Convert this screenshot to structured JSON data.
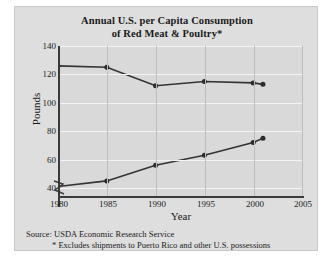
{
  "figure": {
    "title_line1": "Annual U.S. per Capita Consumption",
    "title_line2": "of Red Meat & Poultry*",
    "source": "Source: USDA Economic Research Service",
    "footnote": "* Excludes shipments to Puerto Rico and other U.S. possessions",
    "background_color": "#dedede",
    "plot_background_color": "#d9d9d9",
    "line_color": "#333333",
    "hgrid_color": "#f4f4f4",
    "vgrid_color": "#bdbdbd"
  },
  "chart_data": {
    "type": "line",
    "title": "Annual U.S. per Capita Consumption of Red Meat & Poultry*",
    "xlabel": "Year",
    "ylabel": "Pounds",
    "xlim": [
      1980,
      2005
    ],
    "ylim": [
      35,
      140
    ],
    "yaxis_break": true,
    "grid": true,
    "legend": "none",
    "xticks": [
      1980,
      1985,
      1990,
      1995,
      2000,
      2005
    ],
    "yticks": [
      40,
      60,
      80,
      100,
      120,
      140
    ],
    "series": [
      {
        "name": "Red Meat",
        "x": [
          1980,
          1985,
          1990,
          1995,
          2000,
          2001
        ],
        "values": [
          126,
          125,
          112,
          115,
          114,
          113
        ]
      },
      {
        "name": "Poultry",
        "x": [
          1980,
          1985,
          1990,
          1995,
          2000,
          2001
        ],
        "values": [
          41,
          45,
          56,
          63,
          72,
          75
        ]
      }
    ]
  },
  "axis": {
    "y_tick_labels": [
      "140",
      "120",
      "100",
      "80",
      "60",
      "40"
    ],
    "x_tick_labels": [
      "1980",
      "1985",
      "1990",
      "1995",
      "2000",
      "2005"
    ],
    "y_axis_title": "Pounds",
    "x_axis_title": "Year"
  }
}
